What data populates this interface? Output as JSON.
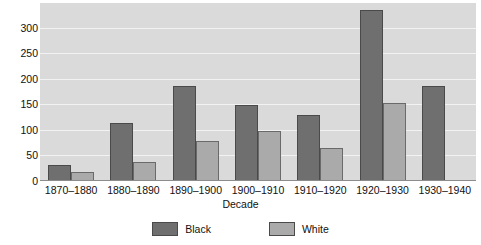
{
  "chart_data": {
    "type": "bar",
    "title": "",
    "subtitle": "",
    "xlabel": "Decade",
    "ylabel": "",
    "categories": [
      "1870–1880",
      "1880–1890",
      "1890–1900",
      "1900–1910",
      "1910–1920",
      "1920–1930",
      "1930–1940"
    ],
    "series": [
      {
        "name": "Black",
        "color": "#6f6f6f",
        "values": [
          32,
          113,
          186,
          148,
          130,
          335,
          186
        ]
      },
      {
        "name": "White",
        "color": "#aaaaaa",
        "values": [
          17,
          38,
          78,
          97,
          64,
          152,
          0
        ]
      }
    ],
    "ylim": [
      0,
      348
    ],
    "yticks": [
      0,
      50,
      100,
      150,
      200,
      250,
      300
    ],
    "ytick_labels": [
      "0",
      "50",
      "100",
      "150",
      "200",
      "250",
      "300"
    ],
    "grid": true,
    "grid_axis": "y",
    "legend_position": "bottom",
    "plot_background": "#dadada",
    "gridline_color": "#f2f2f2",
    "figure_background": "#ffffff",
    "bar_edge_color": "#4a4a4a"
  },
  "legend": {
    "items": [
      {
        "label": "Black",
        "color": "#6f6f6f"
      },
      {
        "label": "White",
        "color": "#aaaaaa"
      }
    ]
  }
}
